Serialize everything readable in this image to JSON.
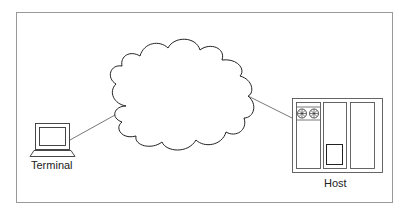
{
  "diagram": {
    "nodes": {
      "terminal": {
        "label": "Terminal",
        "icon": "terminal-icon"
      },
      "network": {
        "label": "",
        "icon": "cloud-icon"
      },
      "host": {
        "label": "Host",
        "icon": "host-computer-icon"
      }
    },
    "edges": [
      {
        "from": "terminal",
        "to": "network"
      },
      {
        "from": "network",
        "to": "host"
      }
    ],
    "colors": {
      "stroke": "#333333",
      "frame": "#999999",
      "background": "#ffffff"
    }
  }
}
